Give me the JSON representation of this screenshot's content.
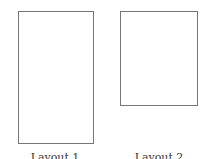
{
  "diagram": {
    "pages": [
      {
        "label": "Layout 1",
        "shape": "tall-rectangle"
      },
      {
        "label": "Layout 2",
        "shape": "short-rectangle"
      }
    ],
    "colors": {
      "border": "#777777",
      "background": "#ffffff"
    }
  }
}
